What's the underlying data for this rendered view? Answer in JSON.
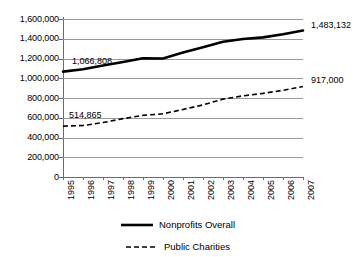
{
  "chart_data": {
    "type": "line",
    "title": "",
    "xlabel": "",
    "ylabel": "",
    "grid": "horizontal",
    "legend_position": "bottom",
    "ylim": [
      0,
      1600000
    ],
    "categories": [
      "1995",
      "1996",
      "1997",
      "1998",
      "1999",
      "2000",
      "2001",
      "2002",
      "2003",
      "2004",
      "2005",
      "2006",
      "2007"
    ],
    "ytick_labels": [
      "1,600,000",
      "1,400,000",
      "1,200,000",
      "1,000,000",
      "800,000",
      "600,000",
      "400,000",
      "200,000",
      "0"
    ],
    "ytick_values": [
      1600000,
      1400000,
      1200000,
      1000000,
      800000,
      600000,
      400000,
      200000,
      0
    ],
    "series": [
      {
        "name": "Nonprofits Overall",
        "style": "solid",
        "color": "#000000",
        "width": 2.6,
        "values": [
          1066808,
          1091000,
          1129000,
          1164000,
          1203000,
          1200000,
          1260000,
          1314000,
          1370000,
          1397000,
          1414000,
          1446000,
          1483132
        ]
      },
      {
        "name": "Public Charities",
        "style": "dashed",
        "color": "#000000",
        "width": 1.6,
        "values": [
          514865,
          521000,
          551000,
          591000,
          624000,
          640000,
          684000,
          730000,
          789000,
          822000,
          847000,
          878000,
          917000
        ]
      }
    ],
    "annotations": [
      {
        "text": "1,066,808",
        "series": "Nonprofits Overall",
        "at": "1995",
        "value": 1066808
      },
      {
        "text": "1,483,132",
        "series": "Nonprofits Overall",
        "at": "2007",
        "value": 1483132
      },
      {
        "text": "514,865",
        "series": "Public Charities",
        "at": "1995",
        "value": 514865
      },
      {
        "text": "917,000",
        "series": "Public Charities",
        "at": "2007",
        "value": 917000
      }
    ]
  },
  "legend": {
    "items": [
      {
        "label": "Nonprofits Overall",
        "style": "solid"
      },
      {
        "label": "Public Charities",
        "style": "dashed"
      }
    ]
  },
  "colors": {
    "series_line": "#000000",
    "gridline": "#9a9a9a",
    "axis": "#6b6b6b",
    "background": "#ffffff",
    "text": "#000000"
  }
}
